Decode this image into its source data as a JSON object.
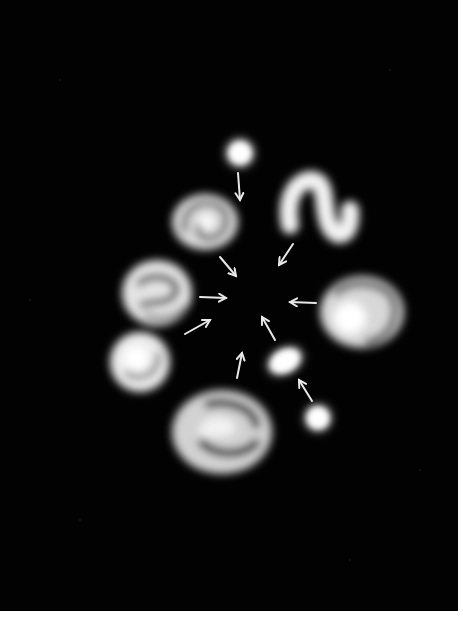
{
  "image": {
    "subject": "Illustration of small galaxies merging toward a common center",
    "colors": {
      "background": "#020202",
      "glow": "#ffffff",
      "arrow": "#e8e8e8",
      "margin": "#ffffff"
    },
    "galaxies": [
      {
        "id": "small-elliptical-top",
        "type": "elliptical",
        "cx": 240,
        "cy": 153
      },
      {
        "id": "spiral-upper-left",
        "type": "spiral",
        "cx": 205,
        "cy": 222
      },
      {
        "id": "s-shaped-upper-right",
        "type": "disrupted-spiral",
        "cx": 318,
        "cy": 208
      },
      {
        "id": "spiral-left",
        "type": "spiral",
        "cx": 157,
        "cy": 293
      },
      {
        "id": "spiral-right",
        "type": "spiral",
        "cx": 360,
        "cy": 313
      },
      {
        "id": "spiral-lower-left",
        "type": "spiral",
        "cx": 140,
        "cy": 362
      },
      {
        "id": "elliptical-center-right",
        "type": "elliptical",
        "cx": 285,
        "cy": 361
      },
      {
        "id": "small-elliptical-lower-right",
        "type": "elliptical",
        "cx": 318,
        "cy": 418
      },
      {
        "id": "spiral-bottom",
        "type": "spiral",
        "cx": 222,
        "cy": 432
      }
    ],
    "arrows_count": 10
  }
}
